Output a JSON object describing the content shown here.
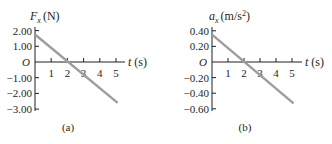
{
  "chart_data": [
    {
      "type": "line",
      "panel_label": "(a)",
      "title": "",
      "ylabel": "F_x (N)",
      "ylabel_var": "F",
      "ylabel_sub": "x",
      "ylabel_unit": "(N)",
      "xlabel": "t (s)",
      "xlabel_var": "t",
      "xlabel_unit": "(s)",
      "origin_label": "O",
      "x_ticks": [
        1,
        2,
        3,
        4,
        5
      ],
      "x_tick_labels": [
        "1",
        "2",
        "3",
        "4",
        "5"
      ],
      "y_ticks": [
        2.0,
        1.0,
        -1.0,
        -2.0,
        -3.0
      ],
      "y_tick_labels": [
        "2.00",
        "1.00",
        "−1.00",
        "−2.00",
        "−3.00"
      ],
      "xlim": [
        0,
        5.6
      ],
      "ylim": [
        -3.0,
        2.2
      ],
      "grid": false,
      "series": [
        {
          "name": "F_x",
          "x": [
            0,
            5.1
          ],
          "y": [
            1.75,
            -2.6
          ],
          "color": "#9d9d9d"
        }
      ]
    },
    {
      "type": "line",
      "panel_label": "(b)",
      "title": "",
      "ylabel": "a_x (m/s^2)",
      "ylabel_var": "a",
      "ylabel_sub": "x",
      "ylabel_unit": "(m/s",
      "ylabel_sup": "2",
      "ylabel_close": ")",
      "xlabel": "t (s)",
      "xlabel_var": "t",
      "xlabel_unit": "(s)",
      "origin_label": "O",
      "x_ticks": [
        1,
        2,
        3,
        4,
        5
      ],
      "x_tick_labels": [
        "1",
        "2",
        "3",
        "4",
        "5"
      ],
      "y_ticks": [
        0.4,
        0.2,
        -0.2,
        -0.4,
        -0.6
      ],
      "y_tick_labels": [
        "0.40",
        "0.20",
        "−0.20",
        "−0.40",
        "−0.60"
      ],
      "xlim": [
        0,
        5.6
      ],
      "ylim": [
        -0.6,
        0.44
      ],
      "grid": false,
      "series": [
        {
          "name": "a_x",
          "x": [
            0,
            5.1
          ],
          "y": [
            0.35,
            -0.53
          ],
          "color": "#9d9d9d"
        }
      ]
    }
  ]
}
